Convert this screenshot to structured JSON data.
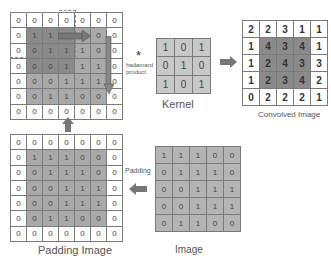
{
  "padded_top": {
    "rows": [
      [
        "0",
        "0",
        "0",
        "0",
        "0",
        "0",
        "0"
      ],
      [
        "0",
        "1",
        "1",
        "1",
        "0",
        "0",
        "0"
      ],
      [
        "0",
        "0",
        "1",
        "1",
        "1",
        "0",
        "0"
      ],
      [
        "0",
        "0",
        "0",
        "1",
        "1",
        "1",
        "0"
      ],
      [
        "0",
        "0",
        "0",
        "1",
        "1",
        "1",
        "0"
      ],
      [
        "0",
        "0",
        "1",
        "1",
        "0",
        "0",
        "0"
      ],
      [
        "0",
        "0",
        "0",
        "0",
        "0",
        "0",
        "0"
      ]
    ]
  },
  "operator": {
    "symbol": "*",
    "line1": "hadamard",
    "line2": "product"
  },
  "kernel": {
    "label": "Kernel",
    "rows": [
      [
        "1",
        "0",
        "1"
      ],
      [
        "0",
        "1",
        "0"
      ],
      [
        "1",
        "0",
        "1"
      ]
    ]
  },
  "convolved": {
    "label": "Convolved Image",
    "rows": [
      [
        "2",
        "2",
        "3",
        "1",
        "1"
      ],
      [
        "1",
        "4",
        "3",
        "4",
        "1"
      ],
      [
        "1",
        "2",
        "4",
        "3",
        "3"
      ],
      [
        "1",
        "2",
        "3",
        "4",
        "2"
      ],
      [
        "0",
        "2",
        "2",
        "2",
        "1"
      ]
    ]
  },
  "padding_image": {
    "label": "Padding Image",
    "rows": [
      [
        "0",
        "0",
        "0",
        "0",
        "0",
        "0",
        "0"
      ],
      [
        "0",
        "1",
        "1",
        "1",
        "0",
        "0",
        "0"
      ],
      [
        "0",
        "0",
        "1",
        "1",
        "1",
        "0",
        "0"
      ],
      [
        "0",
        "0",
        "0",
        "1",
        "1",
        "1",
        "0"
      ],
      [
        "0",
        "0",
        "0",
        "1",
        "1",
        "1",
        "0"
      ],
      [
        "0",
        "0",
        "1",
        "1",
        "0",
        "0",
        "0"
      ],
      [
        "0",
        "0",
        "0",
        "0",
        "0",
        "0",
        "0"
      ]
    ]
  },
  "image": {
    "label": "Image",
    "rows": [
      [
        "1",
        "1",
        "1",
        "0",
        "0"
      ],
      [
        "0",
        "1",
        "1",
        "1",
        "0"
      ],
      [
        "0",
        "0",
        "1",
        "1",
        "1"
      ],
      [
        "0",
        "0",
        "1",
        "1",
        "1"
      ],
      [
        "0",
        "1",
        "1",
        "0",
        "0"
      ]
    ]
  },
  "padding_arrow_label": "Padding",
  "colors": {
    "cell_gray": "#a9a9a9",
    "cell_dark": "#8a8a8a",
    "arrow": "#6e6e6e",
    "border": "#7a7a7a"
  }
}
